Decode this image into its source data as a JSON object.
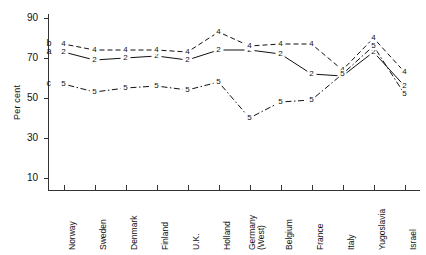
{
  "axis": {
    "ylabel": "Per cent",
    "yticks": [
      10,
      30,
      50,
      70,
      90
    ],
    "ymin": 4,
    "ymax": 92
  },
  "keys": [
    {
      "id": "a",
      "label": "a"
    },
    {
      "id": "b",
      "label": "b"
    },
    {
      "id": "c",
      "label": "c"
    }
  ],
  "chart_data": {
    "type": "line",
    "title": "",
    "xlabel": "",
    "ylabel": "Per cent",
    "ylim": [
      4,
      92
    ],
    "yticks": [
      10,
      30,
      50,
      70,
      90
    ],
    "grid": false,
    "legend": "inline-left-labels",
    "categories": [
      "Norway",
      "Sweden",
      "Denmark",
      "Finland",
      "U.K.",
      "Holland",
      "Germany (West)",
      "Belgium",
      "France",
      "Italy",
      "Yugoslavia",
      "Israel"
    ],
    "series": [
      {
        "name": "a",
        "marker": "2",
        "linestyle": "solid",
        "values": [
          73,
          69,
          70,
          71,
          69,
          74,
          74,
          72,
          62,
          61,
          73,
          56
        ]
      },
      {
        "name": "b",
        "marker": "4",
        "linestyle": "dashed",
        "values": [
          77,
          74,
          74,
          74,
          73,
          83,
          76,
          77,
          77,
          64,
          80,
          63
        ]
      },
      {
        "name": "c",
        "marker": "5",
        "linestyle": "dashdot",
        "values": [
          57,
          53,
          55,
          56,
          54,
          58,
          40,
          48,
          49,
          62,
          76,
          52
        ]
      }
    ]
  }
}
